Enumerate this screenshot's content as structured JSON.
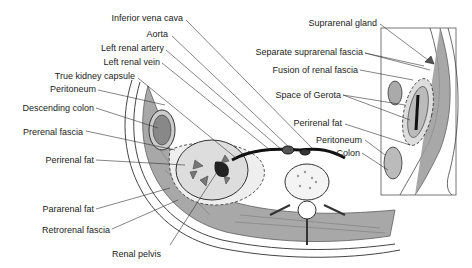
{
  "figure": {
    "main_labels": [
      {
        "id": "ivc",
        "text": "Inferior vena cava"
      },
      {
        "id": "aorta",
        "text": "Aorta"
      },
      {
        "id": "lra",
        "text": "Left renal artery"
      },
      {
        "id": "lrv",
        "text": "Left renal vein"
      },
      {
        "id": "tkc",
        "text": "True kidney capsule"
      },
      {
        "id": "perit",
        "text": "Peritoneum"
      },
      {
        "id": "dcolon",
        "text": "Descending colon"
      },
      {
        "id": "prerenal",
        "text": "Prerenal fascia"
      },
      {
        "id": "perirenal",
        "text": "Perirenal fat"
      },
      {
        "id": "pararenal",
        "text": "Pararenal fat"
      },
      {
        "id": "retrorenal",
        "text": "Retrorenal fascia"
      },
      {
        "id": "pelvis",
        "text": "Renal pelvis"
      }
    ],
    "inset_labels": [
      {
        "id": "supra",
        "text": "Suprarenal gland"
      },
      {
        "id": "sepsupra",
        "text": "Separate suprarenal fascia"
      },
      {
        "id": "fusion",
        "text": "Fusion of renal fascia"
      },
      {
        "id": "gerota",
        "text": "Space of Gerota"
      },
      {
        "id": "iperirenal",
        "text": "Perirenal fat"
      },
      {
        "id": "iperit",
        "text": "Peritoneum"
      },
      {
        "id": "icolon",
        "text": "Colon"
      }
    ],
    "colors": {
      "ink": "#222222",
      "muscle": "#8a8a8a",
      "fat": "#e8e8e8",
      "bone": "#f4f4f4"
    }
  }
}
